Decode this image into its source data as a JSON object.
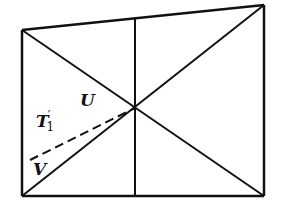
{
  "figure": {
    "width": 282,
    "height": 210,
    "stroke_color": "#111111",
    "background": "#ffffff",
    "points": {
      "top_left": [
        22,
        30
      ],
      "top_right": [
        264,
        5
      ],
      "bottom_left": [
        22,
        196
      ],
      "bottom_right": [
        264,
        196
      ],
      "center": [
        135,
        108
      ],
      "mid_top": [
        135,
        17
      ],
      "mid_bottom": [
        135,
        196
      ],
      "dash_start": [
        30,
        160
      ]
    },
    "labels": {
      "U": {
        "text": "U",
        "x": 80,
        "y": 106
      },
      "T1prime": {
        "text": "T",
        "prime": "′",
        "subscript": "1",
        "x": 36,
        "y": 127
      },
      "V": {
        "text": "V",
        "x": 33,
        "y": 175
      }
    }
  }
}
